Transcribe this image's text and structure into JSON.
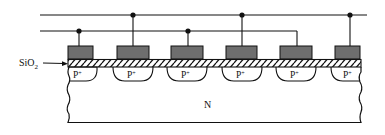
{
  "diagram": {
    "labels": {
      "oxide": "SiO",
      "oxide_subscript": "2",
      "substrate": "N",
      "implant": "P",
      "implant_superscript": "+"
    },
    "colors": {
      "line": "#111111",
      "pad_fill": "#6e6e6e",
      "background": "#ffffff"
    },
    "bus_lines": [
      {
        "name": "upper-bus",
        "y": 15,
        "x_start": 40,
        "x_end": 367
      },
      {
        "name": "lower-bus",
        "y": 31,
        "x_start": 40,
        "x_end": 297
      }
    ],
    "strips": [
      {
        "index": 1,
        "pad_x": 68,
        "pad_w": 25,
        "bus": "lower-bus",
        "implant_x": 68,
        "implant_w": 29,
        "open_left": true
      },
      {
        "index": 2,
        "pad_x": 117,
        "pad_w": 32,
        "bus": "upper-bus",
        "implant_x": 113,
        "implant_w": 40
      },
      {
        "index": 3,
        "pad_x": 171,
        "pad_w": 32,
        "bus": "lower-bus",
        "implant_x": 167,
        "implant_w": 40
      },
      {
        "index": 4,
        "pad_x": 226,
        "pad_w": 31,
        "bus": "upper-bus",
        "implant_x": 222,
        "implant_w": 40
      },
      {
        "index": 5,
        "pad_x": 280,
        "pad_w": 32,
        "bus": "lower-bus",
        "implant_x": 276,
        "implant_w": 40
      },
      {
        "index": 6,
        "pad_x": 335,
        "pad_w": 25,
        "bus": "upper-bus",
        "implant_x": 331,
        "implant_w": 29,
        "open_right": true
      }
    ]
  }
}
